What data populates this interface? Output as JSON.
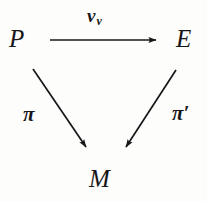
{
  "figure": {
    "type": "commutative-diagram",
    "background_color": "#fdfdfb",
    "ink_color": "#17171a",
    "nodes": [
      {
        "id": "P",
        "label": "P",
        "x": 20,
        "y": 39
      },
      {
        "id": "E",
        "label": "E",
        "x": 187,
        "y": 39
      },
      {
        "id": "M",
        "label": "M",
        "x": 102,
        "y": 179
      }
    ],
    "edges": [
      {
        "id": "top",
        "from": "P",
        "to": "E",
        "label_base": "ν",
        "label_sub": "ν",
        "label_text": "νν",
        "x1": 50,
        "y1": 40,
        "x2": 160,
        "y2": 40
      },
      {
        "id": "left",
        "from": "P",
        "to": "M",
        "label_base": "π",
        "label_sub": "",
        "label_text": "π",
        "x1": 33,
        "y1": 69,
        "x2": 89,
        "y2": 152
      },
      {
        "id": "right",
        "from": "E",
        "to": "M",
        "label_base": "π",
        "label_sub": "",
        "label_prime": "′",
        "label_text": "π′",
        "x1": 176,
        "y1": 70,
        "x2": 123,
        "y2": 152
      }
    ]
  }
}
